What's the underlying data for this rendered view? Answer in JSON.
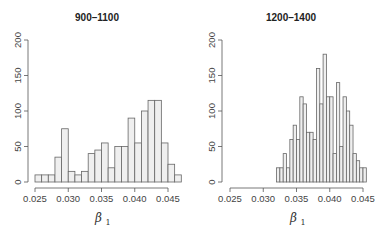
{
  "chart_data": [
    {
      "type": "bar",
      "subtype": "histogram",
      "title": "900–1100",
      "xlabel": "β1",
      "ylabel": "",
      "ylim": [
        0,
        200
      ],
      "yticks": [
        "0",
        "50",
        "100",
        "150",
        "200"
      ],
      "xticks": [
        "0.025",
        "0.030",
        "0.035",
        "0.040",
        "0.045"
      ],
      "xlim": [
        0.025,
        0.047
      ],
      "bin_width": 0.001,
      "bin_start": 0.025,
      "values": [
        10,
        10,
        10,
        35,
        75,
        15,
        10,
        15,
        40,
        45,
        55,
        20,
        50,
        50,
        90,
        55,
        100,
        115,
        115,
        55,
        25,
        10
      ]
    },
    {
      "type": "bar",
      "subtype": "histogram",
      "title": "1200–1400",
      "xlabel": "β1",
      "ylabel": "",
      "ylim": [
        0,
        200
      ],
      "yticks": [
        "0",
        "50",
        "100",
        "150",
        "200"
      ],
      "xticks": [
        "0.025",
        "0.030",
        "0.035",
        "0.040",
        "0.045"
      ],
      "xlim": [
        0.025,
        0.046
      ],
      "bin_width": 0.0005,
      "bin_start": 0.032,
      "values": [
        20,
        20,
        40,
        20,
        60,
        80,
        60,
        120,
        110,
        70,
        70,
        60,
        160,
        110,
        180,
        120,
        120,
        40,
        140,
        50,
        120,
        100,
        80,
        40,
        30,
        20,
        20
      ]
    }
  ],
  "panels": [
    {
      "title": "900–1100",
      "xlabel_main": "β",
      "xlabel_sub": "1"
    },
    {
      "title": "1200–1400",
      "xlabel_main": "β",
      "xlabel_sub": "1"
    }
  ]
}
